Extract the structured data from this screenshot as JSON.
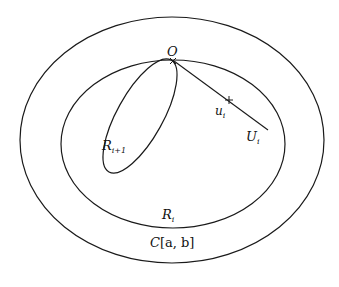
{
  "diagram": {
    "type": "nested-sets",
    "stroke_color": "#1a1a1a",
    "background": "#ffffff",
    "regions": [
      {
        "id": "outer",
        "label_main": "C",
        "label_rest": "[a, b]"
      },
      {
        "id": "inner",
        "label_main": "R",
        "label_sub": "i"
      },
      {
        "id": "tilted",
        "label_main": "R",
        "label_sub": "i+1"
      }
    ],
    "points": [
      {
        "id": "origin",
        "label": "O"
      },
      {
        "id": "u",
        "label_main": "u",
        "label_sub": "i"
      }
    ],
    "segments": [
      {
        "id": "U",
        "label_main": "U",
        "label_sub": "i"
      }
    ]
  }
}
